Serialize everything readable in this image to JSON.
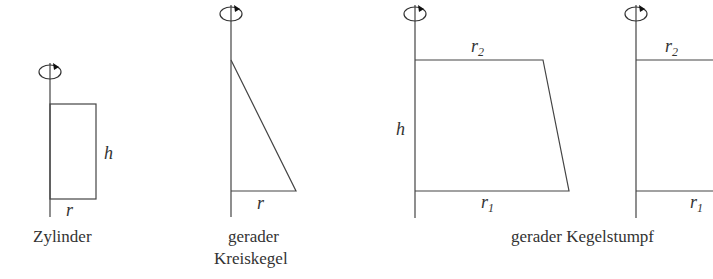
{
  "figures": [
    {
      "id": "zylinder",
      "caption": "Zylinder",
      "labels": {
        "radius": "r",
        "height": "h"
      }
    },
    {
      "id": "kreiskegel",
      "caption_line1": "gerader",
      "caption_line2": "Kreiskegel",
      "labels": {
        "radius": "r"
      }
    },
    {
      "id": "kegelstumpf",
      "caption": "gerader Kegelstumpf",
      "labels": {
        "top_radius": "r",
        "top_sub": "2",
        "bottom_radius": "r",
        "bottom_sub": "1",
        "height": "h"
      }
    },
    {
      "id": "kegelstumpf-partial",
      "labels": {
        "top_radius": "r",
        "top_sub": "2",
        "bottom_radius": "r",
        "bottom_sub": "1"
      }
    }
  ],
  "icons": {
    "rotation": "rotation-arrow-icon"
  }
}
